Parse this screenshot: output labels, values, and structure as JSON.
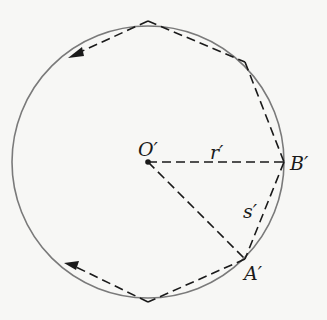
{
  "diagram": {
    "type": "geometry",
    "labels": {
      "center": "O′",
      "radius": "r′",
      "point_b": "B′",
      "chord": "s′",
      "point_a": "A′"
    },
    "colors": {
      "circle": "#7a7a7a",
      "dashes": "#1a1a1a",
      "background": "#f7f7f5"
    }
  }
}
